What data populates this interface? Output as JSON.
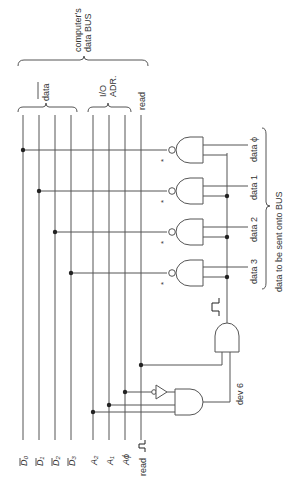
{
  "labels": {
    "bus_title_line1": "computer's",
    "bus_title_line2": "data BUS",
    "data_bar_group": "data",
    "io_adr_line1": "I/O",
    "io_adr_line2": "ADR.",
    "read_group": "read",
    "outputs_title": "data to be sent onto BUS",
    "dev": "dev 6",
    "read_pulse": "read",
    "asterisk": "*"
  },
  "bus_lines": {
    "data": [
      "D̅₀",
      "D̅₁",
      "D̅₂",
      "D̅₃"
    ],
    "addr": [
      "A₂",
      "A₁",
      "A₀"
    ]
  },
  "bus_line_labels": {
    "d0": "D₀",
    "d1": "D₁",
    "d2": "D₂",
    "d3": "D₃",
    "a2": "A₂",
    "a1": "A₁",
    "a0": "Aϕ"
  },
  "outputs": [
    "data ϕ",
    "data 1",
    "data 2",
    "data 3"
  ],
  "colors": {
    "line": "#555555",
    "text": "#333333",
    "background": "#ffffff"
  }
}
